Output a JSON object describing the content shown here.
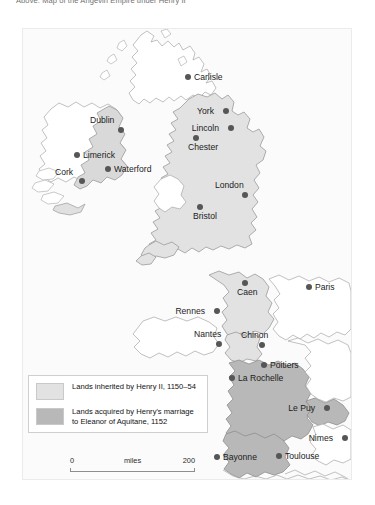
{
  "caption": {
    "text": "Above: Map of the Angevin Empire under Henry II"
  },
  "map": {
    "title": "Angevin Empire under Henry II",
    "colors": {
      "inherited_fill": "#e2e2e2",
      "acquired_fill": "#b8b8b8",
      "unshaded_fill": "#ffffff",
      "coastline": "#9a9a9a",
      "city_dot": "#565656",
      "background": "#fbfbfb"
    },
    "cities": [
      {
        "name": "Carlisle",
        "x": 184,
        "y": 73,
        "label_side": "right"
      },
      {
        "name": "York",
        "x": 222,
        "y": 107,
        "label_side": "left"
      },
      {
        "name": "Lincoln",
        "x": 227,
        "y": 124,
        "label_side": "left"
      },
      {
        "name": "Chester",
        "x": 192,
        "y": 134,
        "label_side": "below"
      },
      {
        "name": "Dublin",
        "x": 117,
        "y": 126,
        "label_side": "above"
      },
      {
        "name": "Limerick",
        "x": 73,
        "y": 151,
        "label_side": "right"
      },
      {
        "name": "Waterford",
        "x": 104,
        "y": 165,
        "label_side": "right"
      },
      {
        "name": "Cork",
        "x": 78,
        "y": 177,
        "label_side": "above"
      },
      {
        "name": "London",
        "x": 241,
        "y": 191,
        "label_side": "above"
      },
      {
        "name": "Bristol",
        "x": 196,
        "y": 203,
        "label_side": "below"
      },
      {
        "name": "Caen",
        "x": 241,
        "y": 279,
        "label_side": "below"
      },
      {
        "name": "Paris",
        "x": 305,
        "y": 283,
        "label_side": "right"
      },
      {
        "name": "Rennes",
        "x": 213,
        "y": 307,
        "label_side": "left"
      },
      {
        "name": "Nantes",
        "x": 215,
        "y": 340,
        "label_side": "above"
      },
      {
        "name": "Chinon",
        "x": 258,
        "y": 341,
        "label_side": "above"
      },
      {
        "name": "Poitiers",
        "x": 260,
        "y": 361,
        "label_side": "right"
      },
      {
        "name": "La Rochelle",
        "x": 228,
        "y": 374,
        "label_side": "right"
      },
      {
        "name": "Le Puy",
        "x": 323,
        "y": 404,
        "label_side": "left"
      },
      {
        "name": "Nimes",
        "x": 341,
        "y": 434,
        "label_side": "left"
      },
      {
        "name": "Bayonne",
        "x": 213,
        "y": 453,
        "label_side": "right"
      },
      {
        "name": "Toulouse",
        "x": 275,
        "y": 452,
        "label_side": "right"
      }
    ]
  },
  "legend": {
    "items": [
      {
        "swatch_color": "#e2e2e2",
        "label": "Lands inherited by Henry II, 1150–54"
      },
      {
        "swatch_color": "#b8b8b8",
        "label": "Lands acquired by Henry's marriage to Eleanor of Aquitane, 1152"
      }
    ]
  },
  "scale": {
    "start": "0",
    "unit": "miles",
    "end": "200"
  }
}
